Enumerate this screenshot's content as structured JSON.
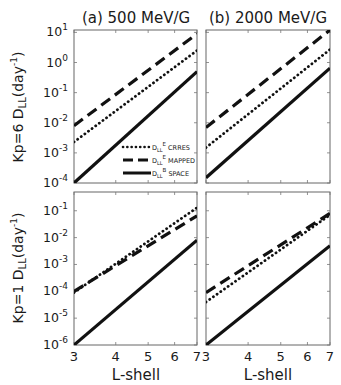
{
  "figure": {
    "panel_titles": [
      "(a) 500 MeV/G",
      "(b) 2000 MeV/G"
    ],
    "row_ylabels": [
      {
        "prefix": "Kp=6 D",
        "sub": "LL",
        "mid": "(day",
        "sup": "-1",
        "suffix": ")"
      },
      {
        "prefix": "Kp=1 D",
        "sub": "LL",
        "mid": "(day",
        "sup": "-1",
        "suffix": ")"
      }
    ],
    "xlabel": "L-shell",
    "legend": [
      {
        "style": "dotted",
        "main": "D",
        "sub": "LL",
        "sup": "E",
        "tail": "CRRES"
      },
      {
        "style": "dashed",
        "main": "D",
        "sub": "LL",
        "sup": "E",
        "tail": "MAPPED"
      },
      {
        "style": "solid",
        "main": "D",
        "sub": "LL",
        "sup": "B",
        "tail": "SPACE"
      }
    ]
  },
  "chart_data": [
    {
      "type": "line",
      "title": "(a) 500 MeV/G",
      "ylabel": "Kp=6 D_LL (day^-1)",
      "xlabel": "",
      "xscale": "log",
      "yscale": "log",
      "xlim": [
        3,
        7
      ],
      "ylim": [
        0.0001,
        12
      ],
      "xticks": [
        3,
        4,
        5,
        6,
        7
      ],
      "yticks": [
        "10^-4",
        "10^-3",
        "10^-2",
        "10^-1",
        "10^0",
        "10^1"
      ],
      "x": [
        3,
        7
      ],
      "series": [
        {
          "name": "D_LL^E CRRES",
          "style": "dotted",
          "values": [
            0.0023,
            2.5
          ]
        },
        {
          "name": "D_LL^E MAPPED",
          "style": "dashed",
          "values": [
            0.008,
            9
          ]
        },
        {
          "name": "D_LL^B SPACE",
          "style": "solid",
          "values": [
            0.0001,
            0.5
          ]
        }
      ],
      "legend_position": "lower right"
    },
    {
      "type": "line",
      "title": "(b) 2000 MeV/G",
      "xscale": "log",
      "yscale": "log",
      "xlim": [
        3,
        7
      ],
      "ylim": [
        0.0001,
        12
      ],
      "x": [
        3,
        7
      ],
      "series": [
        {
          "name": "D_LL^E CRRES",
          "style": "dotted",
          "values": [
            0.0015,
            2.7
          ]
        },
        {
          "name": "D_LL^E MAPPED",
          "style": "dashed",
          "values": [
            0.007,
            12
          ]
        },
        {
          "name": "D_LL^B SPACE",
          "style": "solid",
          "values": [
            0.00015,
            0.65
          ]
        }
      ]
    },
    {
      "type": "line",
      "title": "",
      "ylabel": "Kp=1 D_LL (day^-1)",
      "xlabel": "L-shell",
      "xscale": "log",
      "yscale": "log",
      "xlim": [
        3,
        7
      ],
      "ylim": [
        1e-06,
        0.5
      ],
      "xticks": [
        3,
        4,
        5,
        6,
        7
      ],
      "yticks": [
        "10^-6",
        "10^-5",
        "10^-4",
        "10^-3",
        "10^-2",
        "10^-1"
      ],
      "x": [
        3,
        7
      ],
      "series": [
        {
          "name": "D_LL^E CRRES",
          "style": "dotted",
          "values": [
            9e-05,
            0.13
          ]
        },
        {
          "name": "D_LL^E MAPPED",
          "style": "dashed",
          "values": [
            0.0001,
            0.065
          ]
        },
        {
          "name": "D_LL^B SPACE",
          "style": "solid",
          "values": [
            1e-06,
            0.008
          ]
        }
      ]
    },
    {
      "type": "line",
      "title": "",
      "xlabel": "L-shell",
      "xscale": "log",
      "yscale": "log",
      "xlim": [
        3,
        7
      ],
      "ylim": [
        1e-06,
        0.5
      ],
      "xticks": [
        3,
        4,
        5,
        6,
        7
      ],
      "x": [
        3,
        7
      ],
      "series": [
        {
          "name": "D_LL^E CRRES",
          "style": "dotted",
          "values": [
            4e-05,
            0.07
          ]
        },
        {
          "name": "D_LL^E MAPPED",
          "style": "dashed",
          "values": [
            9e-05,
            0.08
          ]
        },
        {
          "name": "D_LL^B SPACE",
          "style": "solid",
          "values": [
            1e-06,
            0.005
          ]
        }
      ]
    }
  ]
}
